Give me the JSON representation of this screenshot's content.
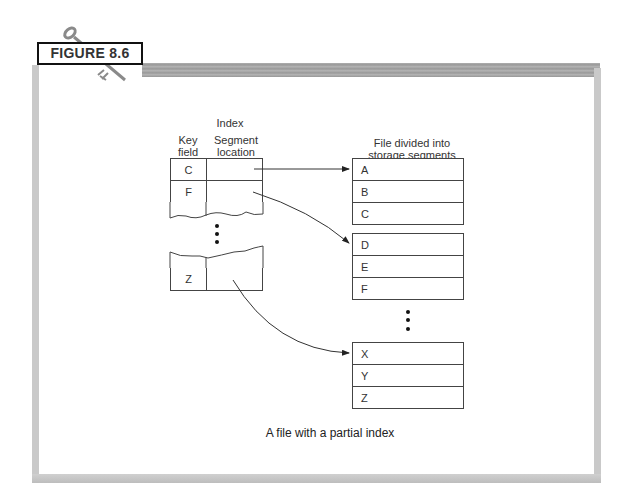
{
  "figure": {
    "label": "FIGURE 8.6",
    "caption": "A file with a partial index"
  },
  "index": {
    "title": "Index",
    "columns": [
      {
        "line1": "Key",
        "line2": "field"
      },
      {
        "line1": "Segment",
        "line2": "location"
      }
    ],
    "rows_top": [
      {
        "key": "C",
        "location": ""
      },
      {
        "key": "F",
        "location": ""
      }
    ],
    "rows_bottom": [
      {
        "key": "Z",
        "location": ""
      }
    ]
  },
  "file": {
    "title_line1": "File divided into",
    "title_line2": "storage segments",
    "segments": [
      {
        "records": [
          "A",
          "B",
          "C"
        ]
      },
      {
        "records": [
          "D",
          "E",
          "F"
        ]
      },
      {
        "records": [
          "X",
          "Y",
          "Z"
        ]
      }
    ]
  },
  "arrows": [
    {
      "from": "C",
      "to_segment": 0
    },
    {
      "from": "F",
      "to_segment": 1
    },
    {
      "from": "Z",
      "to_segment": 2
    }
  ],
  "colors": {
    "frame": "#c9c9c9",
    "line": "#444444",
    "text": "#333333"
  }
}
